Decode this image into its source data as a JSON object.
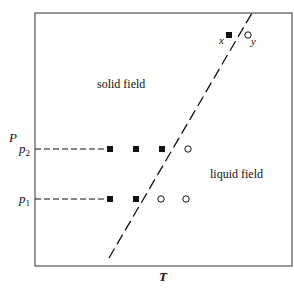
{
  "diagram": {
    "type": "phase-diagram",
    "axes": {
      "x_label": "T",
      "y_label": "P"
    },
    "pressure_levels": [
      {
        "label_main": "p",
        "label_sub": "2",
        "y": 149
      },
      {
        "label_main": "p",
        "label_sub": "1",
        "y": 199
      }
    ],
    "fields": {
      "solid": "solid field",
      "liquid": "liquid field"
    },
    "markers": {
      "x_label": "x",
      "y_label": "y"
    },
    "points": {
      "p2": [
        {
          "x": 110,
          "state": "solid"
        },
        {
          "x": 136,
          "state": "solid"
        },
        {
          "x": 162,
          "state": "solid"
        },
        {
          "x": 188,
          "state": "liquid"
        }
      ],
      "p1": [
        {
          "x": 110,
          "state": "solid"
        },
        {
          "x": 136,
          "state": "solid"
        },
        {
          "x": 161,
          "state": "liquid"
        },
        {
          "x": 186,
          "state": "liquid"
        }
      ]
    },
    "colors": {
      "ink": "#111111",
      "frame": "#333333"
    }
  }
}
